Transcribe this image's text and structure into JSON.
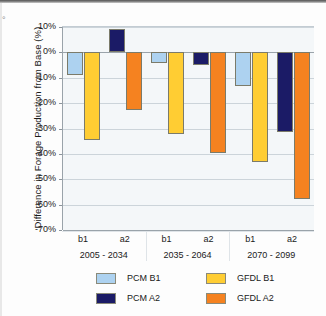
{
  "chart_data": {
    "type": "bar",
    "title": "",
    "xlabel": "",
    "ylabel": "Difference in Forage Production from Base (%)",
    "ylim": [
      -70,
      10
    ],
    "ytick_labels": [
      "10%",
      "0%",
      "-10%",
      "-20%",
      "-30%",
      "-40%",
      "-50%",
      "-60%",
      "-70%"
    ],
    "ytick_values": [
      10,
      0,
      -10,
      -20,
      -30,
      -40,
      -50,
      -60,
      -70
    ],
    "grid": true,
    "legend_position": "bottom",
    "groups": [
      {
        "period": "2005 - 2034",
        "scenarios": [
          {
            "label": "b1",
            "bars": [
              {
                "series": "PCM B1",
                "value": -8.8
              },
              {
                "series": "GFDL B1",
                "value": -34.5
              }
            ]
          },
          {
            "label": "a2",
            "bars": [
              {
                "series": "PCM A2",
                "value": 9.2
              },
              {
                "series": "GFDL A2",
                "value": -22.8
              }
            ]
          }
        ]
      },
      {
        "period": "2035 - 2064",
        "scenarios": [
          {
            "label": "b1",
            "bars": [
              {
                "series": "PCM B1",
                "value": -4.2
              },
              {
                "series": "GFDL B1",
                "value": -32.2
              }
            ]
          },
          {
            "label": "a2",
            "bars": [
              {
                "series": "PCM A2",
                "value": -5.0
              },
              {
                "series": "GFDL A2",
                "value": -39.6
              }
            ]
          }
        ]
      },
      {
        "period": "2070 - 2099",
        "scenarios": [
          {
            "label": "b1",
            "bars": [
              {
                "series": "PCM B1",
                "value": -13.4
              },
              {
                "series": "GFDL B1",
                "value": -43.3
              }
            ]
          },
          {
            "label": "a2",
            "bars": [
              {
                "series": "PCM A2",
                "value": -31.4
              },
              {
                "series": "GFDL A2",
                "value": -57.7
              }
            ]
          }
        ]
      }
    ],
    "series": [
      {
        "name": "PCM B1",
        "color": "#ADD2F0",
        "values": [
          -8.8,
          null,
          -4.2,
          null,
          -13.4,
          null
        ]
      },
      {
        "name": "PCM A2",
        "color": "#1B1B66",
        "values": [
          null,
          9.2,
          null,
          -5.0,
          null,
          -31.4
        ]
      },
      {
        "name": "GFDL B1",
        "color": "#FFCD33",
        "values": [
          -34.5,
          null,
          -32.2,
          null,
          -43.3,
          null
        ]
      },
      {
        "name": "GFDL A2",
        "color": "#F58220",
        "values": [
          null,
          -22.8,
          null,
          -39.6,
          null,
          -57.7
        ]
      }
    ],
    "categories": [
      "b1",
      "a2",
      "b1",
      "a2",
      "b1",
      "a2"
    ]
  },
  "legend": {
    "entries": [
      {
        "label": "PCM B1",
        "color": "#ADD2F0"
      },
      {
        "label": "GFDL B1",
        "color": "#FFCD33"
      },
      {
        "label": "PCM A2",
        "color": "#1B1B66"
      },
      {
        "label": "GFDL A2",
        "color": "#F58220"
      }
    ]
  },
  "edge": {
    "glyph": "°"
  }
}
